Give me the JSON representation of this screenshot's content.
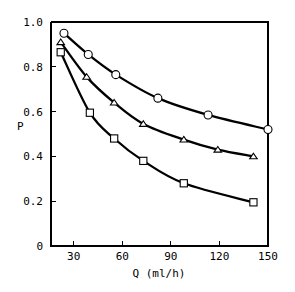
{
  "chart_data": {
    "type": "line",
    "title": "",
    "xlabel": "Q (ml/h)",
    "ylabel": "P",
    "xlim": [
      16,
      150
    ],
    "ylim": [
      0,
      1.0
    ],
    "grid": false,
    "legend": "none",
    "x_ticks": [
      "30",
      "60",
      "90",
      "120",
      "150"
    ],
    "x_tick_values": [
      30,
      60,
      90,
      120,
      150
    ],
    "y_ticks": [
      "0",
      "0.2",
      "0.4",
      "0.6",
      "0.8",
      "1.0"
    ],
    "y_tick_values": [
      0,
      0.2,
      0.4,
      0.6,
      0.8,
      1.0
    ],
    "series": [
      {
        "name": "circle-series",
        "marker": "circle",
        "x": [
          24,
          39,
          56,
          82,
          113,
          150
        ],
        "values": [
          0.95,
          0.855,
          0.765,
          0.66,
          0.585,
          0.52
        ]
      },
      {
        "name": "triangle-series",
        "marker": "triangle",
        "x": [
          22,
          38,
          55,
          73,
          98,
          119,
          141
        ],
        "values": [
          0.91,
          0.755,
          0.64,
          0.545,
          0.475,
          0.43,
          0.4
        ]
      },
      {
        "name": "square-series",
        "marker": "square",
        "x": [
          22,
          40,
          55,
          73,
          98,
          141
        ],
        "values": [
          0.865,
          0.595,
          0.48,
          0.38,
          0.28,
          0.195
        ]
      }
    ]
  },
  "axis_labels": {
    "x_title": "Q (ml/h)",
    "y_title": "P"
  },
  "colors": {
    "line": "#000000",
    "marker_fill": "#ffffff",
    "background": "#ffffff"
  }
}
